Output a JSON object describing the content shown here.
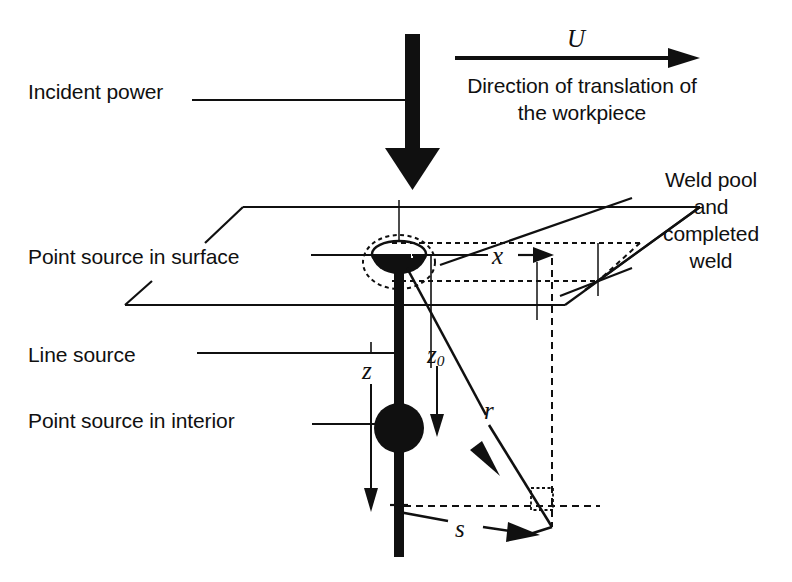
{
  "figure": {
    "background_color": "#ffffff",
    "ink_color": "#101010"
  },
  "labels": {
    "incident_power": "Incident power",
    "direction_line1": "Direction of translation of",
    "direction_line2": "the workpiece",
    "weld_pool_line1": "Weld pool",
    "weld_pool_line2": "and",
    "weld_pool_line3": "completed",
    "weld_pool_line4": "weld",
    "point_source_surface": "Point source in surface",
    "line_source": "Line source",
    "point_source_interior": "Point source in interior"
  },
  "symbols": {
    "velocity": "U",
    "x_coordinate": "x",
    "z_depth_of_source": "z",
    "z_zero_subscript": "0",
    "z_coordinate": "z",
    "radial_distance": "r",
    "surface_distance": "s"
  },
  "elements": {
    "incident_power_arrow": "thick-down-arrow",
    "translation_arrow": "right-arrow",
    "weld_pool": "filled-bowl",
    "interior_point_source": "filled-circle",
    "line_source": "thick-vertical-line",
    "workpiece_surface": "parallelogram-plate",
    "weld_track": "dashed-outline",
    "right_angle_marker": "dashed-square"
  }
}
